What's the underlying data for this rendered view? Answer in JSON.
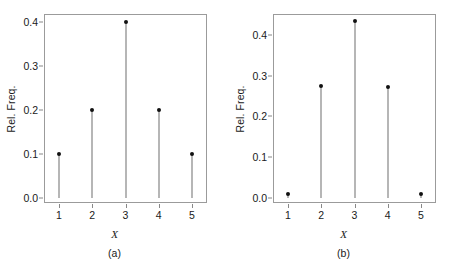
{
  "figure": {
    "background": "#ffffff",
    "frame_color": "#9b9b9b",
    "stem_color": "#6e6e6e",
    "dot_color": "#111111"
  },
  "chart_data": [
    {
      "type": "scatter",
      "subtype": "stem-plot",
      "panel": "a",
      "caption": "(a)",
      "title": "",
      "xlabel": "X",
      "ylabel": "Rel. Freq.",
      "x": [
        1,
        2,
        3,
        4,
        5
      ],
      "values": [
        0.1,
        0.2,
        0.4,
        0.2,
        0.1
      ],
      "categories": [
        "1",
        "2",
        "3",
        "4",
        "5"
      ],
      "xtick_labels": [
        "1",
        "2",
        "3",
        "4",
        "5"
      ],
      "ytick_labels": [
        "0.0",
        "0.1",
        "0.2",
        "0.3",
        "0.4"
      ],
      "yticks": [
        0.0,
        0.1,
        0.2,
        0.3,
        0.4
      ],
      "xlim": [
        0.55,
        5.45
      ],
      "ylim": [
        -0.012,
        0.418
      ],
      "grid": false,
      "legend": null
    },
    {
      "type": "scatter",
      "subtype": "stem-plot",
      "panel": "b",
      "caption": "(b)",
      "title": "",
      "xlabel": "X",
      "ylabel": "Rel. Freq.",
      "x": [
        1,
        2,
        3,
        4,
        5
      ],
      "values": [
        0.01,
        0.275,
        0.435,
        0.272,
        0.01
      ],
      "categories": [
        "1",
        "2",
        "3",
        "4",
        "5"
      ],
      "xtick_labels": [
        "1",
        "2",
        "3",
        "4",
        "5"
      ],
      "ytick_labels": [
        "0.0",
        "0.1",
        "0.2",
        "0.3",
        "0.4"
      ],
      "yticks": [
        0.0,
        0.1,
        0.2,
        0.3,
        0.4
      ],
      "xlim": [
        0.55,
        5.45
      ],
      "ylim": [
        -0.013,
        0.452
      ],
      "grid": false,
      "legend": null
    }
  ]
}
